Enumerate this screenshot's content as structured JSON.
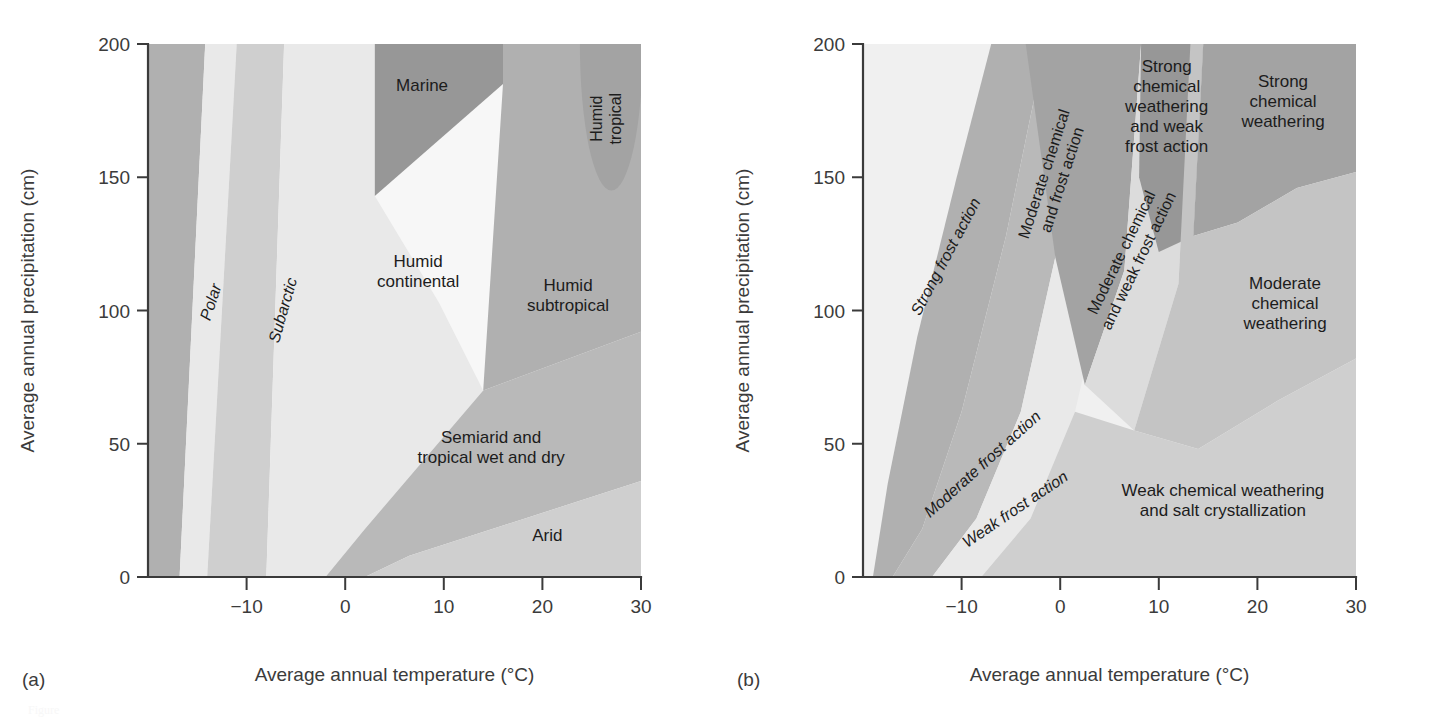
{
  "figure": {
    "panel_a_letter": "(a)",
    "panel_b_letter": "(b)",
    "caption_fragment": "Figure"
  },
  "axes": {
    "x_title": "Average annual temperature (°C)",
    "y_title": "Average annual precipitation (cm)",
    "x_ticks": [
      "−10",
      "0",
      "10",
      "20",
      "30"
    ],
    "y_ticks": [
      "0",
      "50",
      "100",
      "150",
      "200"
    ]
  },
  "colors": {
    "white": "#f7f7f7",
    "lightest": "#f0f0f0",
    "very_light": "#e9e9e9",
    "light": "#dcdcdc",
    "light_mid": "#cfcfcf",
    "mid": "#c4c4c4",
    "mid_gray": "#b9b9b9",
    "gray": "#b0b0b0",
    "dark_gray": "#a3a3a3",
    "darkest": "#979797",
    "axis": "#3b3b3b",
    "text": "#1c1c1c"
  },
  "chart_data": [
    {
      "type": "area",
      "panel": "a",
      "title": "Climate zones as a function of temperature and precipitation",
      "xlabel": "Average annual temperature (°C)",
      "ylabel": "Average annual precipitation (cm)",
      "xlim": [
        -20,
        30
      ],
      "ylim": [
        0,
        200
      ],
      "grid": false,
      "legend": "none",
      "regions": [
        {
          "name": "polar",
          "label": "Polar",
          "rotated": true,
          "italic": true,
          "fill_key": "gray",
          "label_x": -13.5,
          "label_y": 103,
          "label_angle": -72,
          "polygon": [
            [
              -20,
              0
            ],
            [
              -20,
              200
            ],
            [
              -14.2,
              200
            ],
            [
              -16.8,
              0
            ]
          ]
        },
        {
          "name": "polar-subarctic-gap",
          "label": "",
          "fill_key": "very_light",
          "label_x": 0,
          "label_y": 0,
          "label_angle": 0,
          "polygon": [
            [
              -16.8,
              0
            ],
            [
              -14.2,
              200
            ],
            [
              -11.0,
              200
            ],
            [
              -14.0,
              0
            ]
          ]
        },
        {
          "name": "subarctic",
          "label": "Subarctic",
          "rotated": true,
          "italic": true,
          "fill_key": "light_mid",
          "label_x": -6.2,
          "label_y": 100,
          "label_angle": -74,
          "polygon": [
            [
              -14.0,
              0
            ],
            [
              -11.0,
              200
            ],
            [
              -6.2,
              200
            ],
            [
              -8.0,
              0
            ]
          ]
        },
        {
          "name": "humid-continental",
          "label": "Humid\ncontinental",
          "fill_key": "very_light",
          "label_x": 7.4,
          "label_y": 114,
          "label_angle": 0,
          "polygon": [
            [
              -8.0,
              0
            ],
            [
              -6.2,
              200
            ],
            [
              3.0,
              200
            ],
            [
              3.0,
              143
            ],
            [
              9.5,
              103
            ],
            [
              14.0,
              70
            ],
            [
              2.0,
              18
            ],
            [
              -2.0,
              0
            ]
          ]
        },
        {
          "name": "marine",
          "label": "Marine",
          "fill_key": "darkest",
          "label_x": 7.8,
          "label_y": 184,
          "label_angle": 0,
          "polygon": [
            [
              3.0,
              200
            ],
            [
              3.0,
              143
            ],
            [
              16.0,
              185
            ],
            [
              16.0,
              200
            ]
          ]
        },
        {
          "name": "semiarid-tropical",
          "label": "Semiarid and\ntropical wet and dry",
          "fill_key": "mid_gray",
          "label_x": 14.8,
          "label_y": 48,
          "label_angle": 0,
          "polygon": [
            [
              -2.0,
              0
            ],
            [
              2.0,
              18
            ],
            [
              14.0,
              70
            ],
            [
              30.0,
              92
            ],
            [
              30.0,
              36
            ],
            [
              6.5,
              8
            ],
            [
              2.0,
              0
            ]
          ]
        },
        {
          "name": "arid",
          "label": "Arid",
          "fill_key": "light_mid",
          "label_x": 20.5,
          "label_y": 15,
          "label_angle": 0,
          "polygon": [
            [
              2.0,
              0
            ],
            [
              6.5,
              8
            ],
            [
              30.0,
              36
            ],
            [
              30.0,
              0
            ]
          ]
        },
        {
          "name": "humid-subtropical",
          "label": "Humid\nsubtropical",
          "fill_key": "gray",
          "label_x": 22.6,
          "label_y": 105,
          "label_angle": 0,
          "polygon": [
            [
              16.0,
              200
            ],
            [
              16.0,
              185
            ],
            [
              14.0,
              70
            ],
            [
              30.0,
              92
            ],
            [
              30.0,
              200
            ]
          ]
        },
        {
          "name": "humid-tropical",
          "label": "Humid\ntropical",
          "rotated": true,
          "fill_key": "dark_gray",
          "label_x": 26.6,
          "label_y": 172,
          "label_angle": -90,
          "blob": {
            "cx": 27.0,
            "cy": 200,
            "rx": 3.2,
            "ry": 55
          }
        }
      ]
    },
    {
      "type": "area",
      "panel": "b",
      "title": "Weathering regimes as a function of temperature and precipitation",
      "xlabel": "Average annual temperature (°C)",
      "ylabel": "Average annual precipitation (cm)",
      "xlim": [
        -20,
        30
      ],
      "ylim": [
        0,
        200
      ],
      "grid": false,
      "legend": "none",
      "regions": [
        {
          "name": "background-weak-chemical",
          "label": "",
          "fill_key": "lightest",
          "label_x": 0,
          "label_y": 0,
          "label_angle": 0,
          "polygon": [
            [
              -20,
              0
            ],
            [
              -20,
              200
            ],
            [
              30,
              200
            ],
            [
              30,
              0
            ]
          ]
        },
        {
          "name": "strong-frost-action",
          "label": "Strong frost action",
          "rotated": true,
          "italic": true,
          "fill_key": "gray",
          "label_x": -11.5,
          "label_y": 120,
          "label_angle": -62,
          "polygon": [
            [
              -19.0,
              0
            ],
            [
              -17.5,
              35
            ],
            [
              -14.5,
              90
            ],
            [
              -10.5,
              150
            ],
            [
              -7.0,
              200
            ],
            [
              -1.5,
              200
            ],
            [
              -5.5,
              128
            ],
            [
              -10.0,
              62
            ],
            [
              -14.0,
              18
            ],
            [
              -17.0,
              0
            ]
          ]
        },
        {
          "name": "moderate-frost-action",
          "label": "Moderate frost action",
          "rotated": true,
          "italic": true,
          "fill_key": "mid_gray",
          "label_x": -7.8,
          "label_y": 42,
          "label_angle": -42,
          "polygon": [
            [
              -17.0,
              0
            ],
            [
              -14.0,
              18
            ],
            [
              -10.0,
              62
            ],
            [
              -5.5,
              128
            ],
            [
              -1.5,
              200
            ],
            [
              3.2,
              200
            ],
            [
              -0.5,
              120
            ],
            [
              -4.0,
              62
            ],
            [
              -8.5,
              22
            ],
            [
              -13.0,
              0
            ]
          ]
        },
        {
          "name": "weak-frost-action",
          "label": "Weak frost action",
          "rotated": true,
          "italic": true,
          "fill_key": "very_light",
          "label_x": -4.5,
          "label_y": 25,
          "label_angle": -34,
          "polygon": [
            [
              -13.0,
              0
            ],
            [
              -8.5,
              22
            ],
            [
              -4.0,
              62
            ],
            [
              -0.5,
              120
            ],
            [
              3.2,
              200
            ],
            [
              8.0,
              200
            ],
            [
              5.0,
              118
            ],
            [
              1.5,
              62
            ],
            [
              -3.0,
              22
            ],
            [
              -8.0,
              0
            ]
          ]
        },
        {
          "name": "moderate-chemical-and-frost-action",
          "label": "Moderate chemical\nand frost action",
          "rotated": true,
          "fill_key": "dark_gray",
          "label_x": -0.6,
          "label_y": 150,
          "label_angle": -72,
          "polygon": [
            [
              -3.5,
              200
            ],
            [
              -0.5,
              120
            ],
            [
              2.5,
              72
            ],
            [
              6.5,
              115
            ],
            [
              8.2,
              200
            ]
          ]
        },
        {
          "name": "moderate-chemical-and-weak-frost-action",
          "label": "Moderate chemical\nand weak frost action",
          "rotated": true,
          "fill_key": "light",
          "label_x": 7.2,
          "label_y": 120,
          "label_angle": -64,
          "polygon": [
            [
              8.2,
              200
            ],
            [
              6.5,
              115
            ],
            [
              2.5,
              72
            ],
            [
              7.5,
              55
            ],
            [
              12.0,
              110
            ],
            [
              13.2,
              200
            ]
          ]
        },
        {
          "name": "strong-chemical-weathering-and-weak-frost-action",
          "label": "Strong\nchemical\nweathering\nand weak\nfrost action",
          "fill_key": "darkest",
          "label_x": 10.8,
          "label_y": 176,
          "label_angle": 0,
          "polygon": [
            [
              8.2,
              200
            ],
            [
              8.0,
              150
            ],
            [
              10.0,
              122
            ],
            [
              13.5,
              128
            ],
            [
              14.5,
              200
            ]
          ]
        },
        {
          "name": "strong-chemical-weathering",
          "label": "Strong\nchemical\nweathering",
          "fill_key": "dark_gray",
          "label_x": 22.6,
          "label_y": 178,
          "label_angle": 0,
          "polygon": [
            [
              14.5,
              200
            ],
            [
              13.5,
              128
            ],
            [
              18.0,
              133
            ],
            [
              24.0,
              146
            ],
            [
              30.0,
              152
            ],
            [
              30.0,
              200
            ]
          ]
        },
        {
          "name": "moderate-chemical-weathering",
          "label": "Moderate\nchemical\nweathering",
          "fill_key": "mid",
          "label_x": 22.8,
          "label_y": 102,
          "label_angle": 0,
          "polygon": [
            [
              13.2,
              200
            ],
            [
              12.0,
              110
            ],
            [
              7.5,
              55
            ],
            [
              14.0,
              48
            ],
            [
              22.0,
              66
            ],
            [
              30.0,
              82
            ],
            [
              30.0,
              152
            ],
            [
              24.0,
              146
            ],
            [
              18.0,
              133
            ],
            [
              13.5,
              128
            ],
            [
              14.5,
              200
            ]
          ]
        },
        {
          "name": "weak-chemical-weathering-and-salt-crystallization",
          "label": "Weak chemical weathering\nand salt crystallization",
          "fill_key": "light_mid",
          "label_x": 16.5,
          "label_y": 28,
          "label_angle": 0,
          "polygon": [
            [
              -19.0,
              0
            ],
            [
              -8.0,
              0
            ],
            [
              -3.0,
              22
            ],
            [
              1.5,
              62
            ],
            [
              7.5,
              55
            ],
            [
              14.0,
              48
            ],
            [
              22.0,
              66
            ],
            [
              30.0,
              82
            ],
            [
              30.0,
              0
            ]
          ]
        }
      ]
    }
  ]
}
